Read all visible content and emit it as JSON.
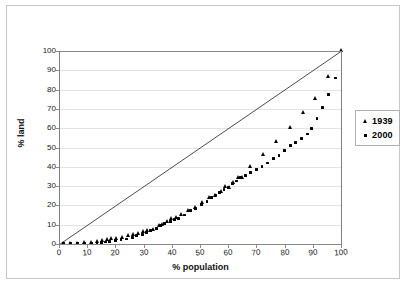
{
  "chart_data": {
    "type": "scatter",
    "title": "",
    "xlabel": "% population",
    "ylabel": "% land",
    "xlim": [
      0,
      100
    ],
    "ylim": [
      0,
      100
    ],
    "xticks": [
      0,
      10,
      20,
      30,
      40,
      50,
      60,
      70,
      80,
      90,
      100
    ],
    "yticks": [
      0,
      10,
      20,
      30,
      40,
      50,
      60,
      70,
      80,
      90,
      100
    ],
    "grid": "horizontal",
    "legend_position": "right",
    "annotations": [
      "equality line from (0,0) to (100,100)"
    ],
    "series": [
      {
        "name": "1939",
        "marker": "triangle",
        "color": "#000000",
        "points": [
          [
            1.5,
            0.2
          ],
          [
            4.0,
            0.3
          ],
          [
            6.5,
            0.4
          ],
          [
            9.0,
            0.5
          ],
          [
            11.5,
            0.7
          ],
          [
            13.5,
            1.2
          ],
          [
            15.5,
            1.6
          ],
          [
            17.0,
            2.4
          ],
          [
            18.5,
            2.6
          ],
          [
            20.5,
            2.8
          ],
          [
            22.5,
            3.2
          ],
          [
            24.5,
            4.2
          ],
          [
            26.5,
            4.8
          ],
          [
            28.0,
            5.2
          ],
          [
            30.0,
            6.6
          ],
          [
            31.5,
            7.2
          ],
          [
            33.5,
            7.4
          ],
          [
            35.5,
            9.6
          ],
          [
            36.5,
            10.2
          ],
          [
            38.5,
            11.4
          ],
          [
            40.0,
            13.0
          ],
          [
            41.5,
            13.6
          ],
          [
            43.5,
            15.2
          ],
          [
            46.0,
            17.4
          ],
          [
            48.5,
            19.0
          ],
          [
            51.0,
            21.2
          ],
          [
            53.5,
            24.0
          ],
          [
            55.5,
            25.2
          ],
          [
            57.5,
            27.0
          ],
          [
            59.0,
            29.6
          ],
          [
            60.5,
            29.4
          ],
          [
            62.0,
            31.8
          ],
          [
            63.5,
            34.4
          ],
          [
            65.0,
            34.6
          ],
          [
            68.0,
            40.0
          ],
          [
            72.5,
            46.2
          ],
          [
            77.0,
            53.2
          ],
          [
            82.0,
            60.4
          ],
          [
            86.5,
            68.0
          ],
          [
            91.0,
            75.4
          ],
          [
            95.5,
            86.6
          ],
          [
            100.0,
            100.0
          ]
        ]
      },
      {
        "name": "2000",
        "marker": "square",
        "color": "#000000",
        "points": [
          [
            1.5,
            0.1
          ],
          [
            4.0,
            0.1
          ],
          [
            6.5,
            0.2
          ],
          [
            9.0,
            0.2
          ],
          [
            11.5,
            0.3
          ],
          [
            13.5,
            0.6
          ],
          [
            15.0,
            0.8
          ],
          [
            16.5,
            1.0
          ],
          [
            18.0,
            1.4
          ],
          [
            20.0,
            1.8
          ],
          [
            22.0,
            2.2
          ],
          [
            24.0,
            2.6
          ],
          [
            26.0,
            3.4
          ],
          [
            27.5,
            4.4
          ],
          [
            29.5,
            5.0
          ],
          [
            31.0,
            6.0
          ],
          [
            32.5,
            6.8
          ],
          [
            34.5,
            8.0
          ],
          [
            36.0,
            9.4
          ],
          [
            37.5,
            10.6
          ],
          [
            39.5,
            11.6
          ],
          [
            41.0,
            12.6
          ],
          [
            42.5,
            13.4
          ],
          [
            44.5,
            15.0
          ],
          [
            46.5,
            17.2
          ],
          [
            48.5,
            18.6
          ],
          [
            50.5,
            20.4
          ],
          [
            52.5,
            22.2
          ],
          [
            54.0,
            24.2
          ],
          [
            55.5,
            25.4
          ],
          [
            57.0,
            26.8
          ],
          [
            58.5,
            28.4
          ],
          [
            60.0,
            29.4
          ],
          [
            61.5,
            31.2
          ],
          [
            63.0,
            32.6
          ],
          [
            64.5,
            34.4
          ],
          [
            66.0,
            35.4
          ],
          [
            68.0,
            37.2
          ],
          [
            70.0,
            38.6
          ],
          [
            72.0,
            40.2
          ],
          [
            74.0,
            42.0
          ],
          [
            76.0,
            44.2
          ],
          [
            78.0,
            46.0
          ],
          [
            80.0,
            48.4
          ],
          [
            82.0,
            51.2
          ],
          [
            84.0,
            52.8
          ],
          [
            86.0,
            54.8
          ],
          [
            88.0,
            57.0
          ],
          [
            89.5,
            60.0
          ],
          [
            91.5,
            65.2
          ],
          [
            93.5,
            70.6
          ],
          [
            95.5,
            77.4
          ],
          [
            98.0,
            86.0
          ],
          [
            100.0,
            100.0
          ]
        ]
      }
    ]
  },
  "legend": {
    "items": [
      {
        "label": "1939",
        "marker": "triangle-icon"
      },
      {
        "label": "2000",
        "marker": "square-icon"
      }
    ]
  },
  "axes": {
    "y_title": "% land",
    "x_title": "% population"
  }
}
